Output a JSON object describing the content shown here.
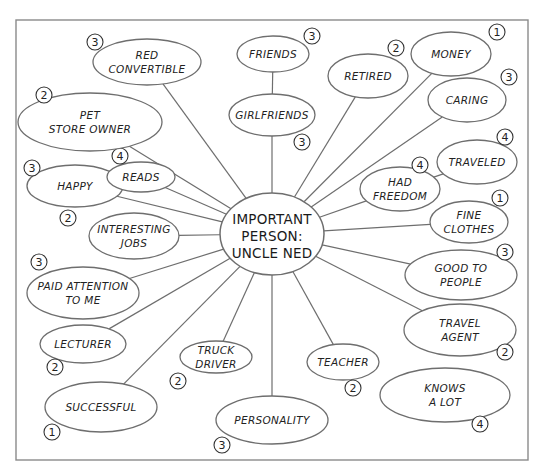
{
  "diagram": {
    "type": "concept-map",
    "title": "Important Person: Uncle Ned",
    "center": {
      "lines": [
        "IMPORTANT",
        "PERSON:",
        "UNCLE NED"
      ],
      "cx": 272,
      "cy": 234,
      "rx": 52,
      "ry": 41
    },
    "nodes": [
      {
        "id": "red-convertible",
        "lines": [
          "RED",
          "CONVERTIBLE"
        ],
        "rating": "3",
        "cx": 147,
        "cy": 62,
        "rx": 54,
        "ry": 23,
        "badge": [
          95,
          42
        ],
        "connects_to": "center"
      },
      {
        "id": "friends",
        "lines": [
          "FRIENDS"
        ],
        "rating": "3",
        "cx": 273,
        "cy": 54,
        "rx": 36,
        "ry": 18,
        "badge": [
          312,
          36
        ],
        "connects_to": "girlfriends"
      },
      {
        "id": "girlfriends",
        "lines": [
          "GIRLFRIENDS"
        ],
        "rating": "3",
        "cx": 272,
        "cy": 115,
        "rx": 43,
        "ry": 21,
        "badge": [
          302,
          142
        ],
        "connects_to": "center"
      },
      {
        "id": "retired",
        "lines": [
          "RETIRED"
        ],
        "rating": "2",
        "cx": 368,
        "cy": 76,
        "rx": 40,
        "ry": 22,
        "badge": [
          396,
          48
        ],
        "connects_to": "center"
      },
      {
        "id": "money",
        "lines": [
          "MONEY"
        ],
        "rating": "1",
        "cx": 451,
        "cy": 54,
        "rx": 40,
        "ry": 22,
        "badge": [
          497,
          32
        ],
        "connects_to": "center"
      },
      {
        "id": "caring",
        "lines": [
          "CARING"
        ],
        "rating": "3",
        "cx": 467,
        "cy": 100,
        "rx": 39,
        "ry": 22,
        "badge": [
          509,
          77
        ],
        "connects_to": "center"
      },
      {
        "id": "traveled",
        "lines": [
          "TRAVELED"
        ],
        "rating": "4",
        "cx": 477,
        "cy": 162,
        "rx": 40,
        "ry": 22,
        "badge": [
          505,
          137
        ],
        "connects_to": "had-freedom"
      },
      {
        "id": "had-freedom",
        "lines": [
          "HAD",
          "FREEDOM"
        ],
        "rating": "4",
        "cx": 400,
        "cy": 189,
        "rx": 40,
        "ry": 22,
        "badge": [
          420,
          165
        ],
        "connects_to": "center"
      },
      {
        "id": "fine-clothes",
        "lines": [
          "FINE",
          "CLOTHES"
        ],
        "rating": "1",
        "cx": 469,
        "cy": 222,
        "rx": 39,
        "ry": 21,
        "badge": [
          500,
          198
        ],
        "connects_to": "center"
      },
      {
        "id": "good-to-people",
        "lines": [
          "GOOD TO",
          "PEOPLE"
        ],
        "rating": "3",
        "cx": 461,
        "cy": 275,
        "rx": 56,
        "ry": 25,
        "badge": [
          505,
          252
        ],
        "connects_to": "center"
      },
      {
        "id": "travel-agent",
        "lines": [
          "TRAVEL",
          "AGENT"
        ],
        "rating": "2",
        "cx": 460,
        "cy": 330,
        "rx": 56,
        "ry": 26,
        "badge": [
          505,
          352
        ],
        "connects_to": "center"
      },
      {
        "id": "teacher",
        "lines": [
          "TEACHER"
        ],
        "rating": "2",
        "cx": 343,
        "cy": 362,
        "rx": 36,
        "ry": 18,
        "badge": [
          353,
          388
        ],
        "connects_to": "center"
      },
      {
        "id": "knows-a-lot",
        "lines": [
          "KNOWS",
          "A LOT"
        ],
        "rating": "4",
        "cx": 445,
        "cy": 395,
        "rx": 65,
        "ry": 27,
        "badge": [
          480,
          424
        ],
        "connects_to": null
      },
      {
        "id": "personality",
        "lines": [
          "PERSONALITY"
        ],
        "rating": "3",
        "cx": 272,
        "cy": 420,
        "rx": 56,
        "ry": 24,
        "badge": [
          222,
          445
        ],
        "connects_to": "center"
      },
      {
        "id": "truck-driver",
        "lines": [
          "TRUCK",
          "DRIVER"
        ],
        "rating": "2",
        "cx": 216,
        "cy": 357,
        "rx": 36,
        "ry": 16,
        "badge": [
          178,
          381
        ],
        "connects_to": "center"
      },
      {
        "id": "successful",
        "lines": [
          "SUCCESSFUL"
        ],
        "rating": "1",
        "cx": 101,
        "cy": 407,
        "rx": 56,
        "ry": 25,
        "badge": [
          52,
          432
        ],
        "connects_to": "center"
      },
      {
        "id": "lecturer",
        "lines": [
          "LECTURER"
        ],
        "rating": "2",
        "cx": 83,
        "cy": 344,
        "rx": 43,
        "ry": 19,
        "badge": [
          55,
          367
        ],
        "connects_to": "center"
      },
      {
        "id": "paid-attention-to-me",
        "lines": [
          "PAID ATTENTION",
          "TO ME"
        ],
        "rating": "3",
        "cx": 83,
        "cy": 293,
        "rx": 56,
        "ry": 26,
        "badge": [
          39,
          262
        ],
        "connects_to": "center"
      },
      {
        "id": "interesting-jobs",
        "lines": [
          "INTERESTING",
          "JOBS"
        ],
        "rating": "2",
        "cx": 134,
        "cy": 236,
        "rx": 45,
        "ry": 23,
        "badge": [
          68,
          218
        ],
        "connects_to": "center"
      },
      {
        "id": "happy",
        "lines": [
          "HAPPY"
        ],
        "rating": "3",
        "cx": 75,
        "cy": 186,
        "rx": 48,
        "ry": 21,
        "badge": [
          32,
          168
        ],
        "connects_to": "center"
      },
      {
        "id": "reads",
        "lines": [
          "READS"
        ],
        "rating": "4",
        "cx": 141,
        "cy": 177,
        "rx": 34,
        "ry": 15,
        "badge": [
          120,
          156
        ],
        "connects_to": "center"
      },
      {
        "id": "pet-store-owner",
        "lines": [
          "PET",
          "STORE OWNER"
        ],
        "rating": "2",
        "cx": 90,
        "cy": 122,
        "rx": 72,
        "ry": 29,
        "badge": [
          44,
          95
        ],
        "connects_to": "center"
      }
    ],
    "frame": {
      "x": 16,
      "y": 20,
      "width": 512,
      "height": 440
    },
    "colors": {
      "line": "#6e6e6e",
      "frame": "#8a8a8a",
      "text": "#222222",
      "background": "#ffffff"
    }
  }
}
